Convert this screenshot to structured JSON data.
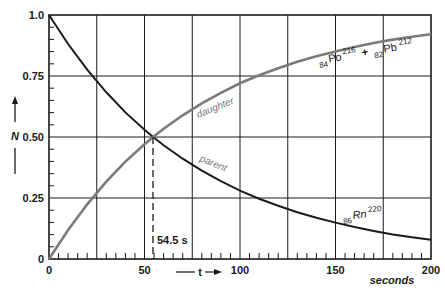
{
  "chart_data": {
    "type": "line",
    "title": "",
    "xlabel": "t",
    "x_unit_label": "seconds",
    "ylabel": "N",
    "xlim": [
      0,
      200
    ],
    "ylim": [
      0,
      1.0
    ],
    "grid": true,
    "x_ticks": [
      "0",
      "50",
      "100",
      "150",
      "200"
    ],
    "y_ticks": [
      "0",
      "0.25",
      "0.50",
      "0.75",
      "1.0"
    ],
    "x": [
      0,
      10,
      20,
      30,
      40,
      50,
      54.5,
      60,
      70,
      80,
      90,
      100,
      110,
      120,
      130,
      140,
      150,
      160,
      170,
      180,
      190,
      200
    ],
    "series": [
      {
        "name": "parent",
        "label": "86Rn220",
        "color": "#1a1a1a",
        "values": [
          1.0,
          0.881,
          0.776,
          0.683,
          0.601,
          0.53,
          0.5,
          0.466,
          0.411,
          0.362,
          0.319,
          0.28,
          0.247,
          0.218,
          0.192,
          0.169,
          0.149,
          0.131,
          0.115,
          0.101,
          0.089,
          0.079
        ]
      },
      {
        "name": "daughter",
        "label": "84Po216 + 82Pb212",
        "color": "#7a7a7a",
        "values": [
          0.0,
          0.119,
          0.224,
          0.317,
          0.399,
          0.47,
          0.5,
          0.534,
          0.589,
          0.638,
          0.681,
          0.72,
          0.753,
          0.782,
          0.808,
          0.831,
          0.851,
          0.869,
          0.885,
          0.899,
          0.911,
          0.921
        ]
      }
    ],
    "annotations": [
      {
        "text": "54.5 s",
        "x": 54.5,
        "note": "half-life, dashed vertical line from crossing point"
      },
      {
        "text": "daughter",
        "series": "daughter"
      },
      {
        "text": "parent",
        "series": "parent"
      }
    ],
    "legend_position": "inline labels"
  },
  "labels": {
    "y_axis_symbol": "N",
    "x_axis_symbol": "t",
    "seconds": "seconds",
    "half_life": "54.5 s",
    "daughter": "daughter",
    "parent": "parent",
    "rn_z": "86",
    "rn_sym": "Rn",
    "rn_a": "220",
    "po_z": "84",
    "po_sym": "Po",
    "po_a": "216",
    "plus": "+",
    "pb_z": "82",
    "pb_sym": "Pb",
    "pb_a": "212"
  }
}
